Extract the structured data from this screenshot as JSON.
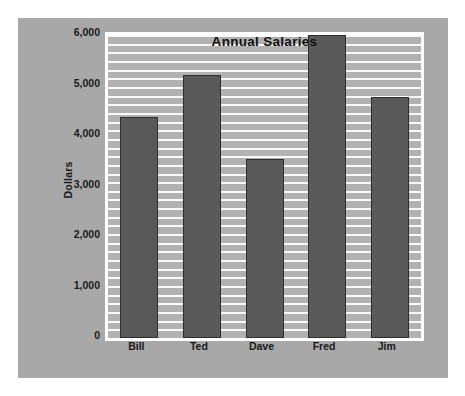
{
  "chart_data": {
    "type": "bar",
    "title": "Annual Salaries",
    "xlabel": "",
    "ylabel": "Dollars",
    "categories": [
      "Bill",
      "Ted",
      "Dave",
      "Fred",
      "Jim"
    ],
    "values": [
      4370,
      5200,
      3550,
      6000,
      4780
    ],
    "ylim": [
      0,
      6000
    ],
    "ytick_values": [
      0,
      1000,
      2000,
      3000,
      4000,
      5000,
      6000
    ],
    "ytick_labels": [
      "0",
      "1,000",
      "2,000",
      "3,000",
      "4,000",
      "5,000",
      "6,000"
    ],
    "grid": true,
    "grid_orientation": "horizontal",
    "grid_minor_count": 35,
    "legend": false,
    "legend_position": "none",
    "series": [
      {
        "name": "Annual Salaries",
        "values": [
          4370,
          5200,
          3550,
          6000,
          4780
        ]
      }
    ]
  },
  "colors": {
    "panel_background": "#a8a8a8",
    "plot_background": "#b2b2b2",
    "plot_border": "#ffffff",
    "gridline": "#fafafa",
    "bar_fill": "#595959",
    "bar_border": "#2e2e2e",
    "text": "#1a1a1a",
    "title_text": "#111111",
    "page_background": "#ffffff"
  }
}
